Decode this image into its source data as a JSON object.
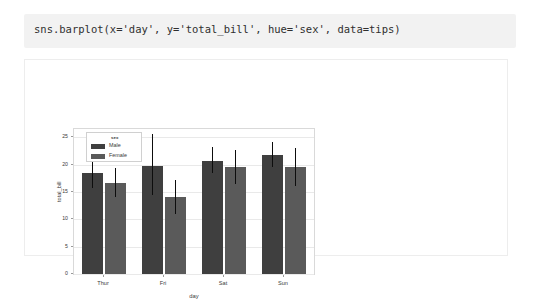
{
  "notebook": {
    "code_cell": {
      "source": "sns.barplot(x='day', y='total_bill', hue='sex', data=tips)"
    }
  },
  "chart_data": {
    "type": "bar",
    "title": "",
    "xlabel": "day",
    "ylabel": "total_bill",
    "categories": [
      "Thur",
      "Fri",
      "Sat",
      "Sun"
    ],
    "legend_title": "sex",
    "legend_position": "upper left",
    "grid": true,
    "ylim": [
      0,
      26.5
    ],
    "yticks": [
      0,
      5,
      10,
      15,
      20,
      25
    ],
    "ytick_labels": [
      "0",
      "5",
      "10",
      "15",
      "20",
      "25"
    ],
    "series": [
      {
        "name": "Male",
        "color": "#3f3f3f",
        "values": [
          18.5,
          19.8,
          20.6,
          21.8
        ],
        "ci_low": [
          15.7,
          14.4,
          18.5,
          19.6
        ],
        "ci_high": [
          21.2,
          25.5,
          23.3,
          24.2
        ]
      },
      {
        "name": "Female",
        "color": "#5a5a5a",
        "values": [
          16.6,
          14.0,
          19.5,
          19.6
        ],
        "ci_low": [
          14.1,
          11.0,
          16.4,
          16.1
        ],
        "ci_high": [
          19.4,
          17.1,
          22.7,
          23.1
        ]
      }
    ]
  },
  "colors": {
    "cell_background": "#f2f2f2",
    "figure_background": "#ffffff",
    "grid": "#e9e9e9",
    "axes_border": "#d9d9d9",
    "text": "#3a3a3a"
  }
}
